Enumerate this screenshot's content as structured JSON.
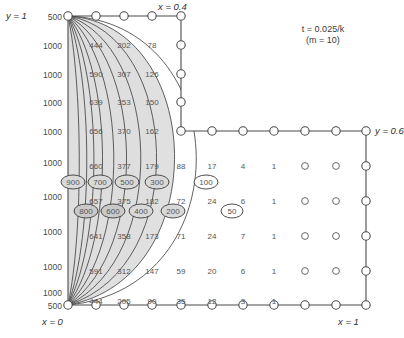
{
  "figure": {
    "annotation": {
      "line1": "t = 0.025/k",
      "line2": "(m = 10)",
      "t_symbol": "t",
      "t_value": "= 0.025/k",
      "m_symbol": "m",
      "m_value": "= 10)"
    },
    "axis_labels": {
      "top_left": "y = 1",
      "top_right": "x = 0.4",
      "bottom_left": "x = 0",
      "bottom_right": "x = 1",
      "right": "y = 0.6"
    },
    "boundary_row_labels": [
      "500",
      "1000",
      "1000",
      "1000",
      "1000",
      "1000",
      "1000",
      "1000",
      "1000",
      "1000",
      "500"
    ],
    "contour_labels_upper": [
      "900",
      "700",
      "500",
      "300",
      "100"
    ],
    "contour_labels_lower": [
      "800",
      "600",
      "400",
      "200"
    ],
    "contour_label_50": "50"
  },
  "chart_data": {
    "type": "heatmap",
    "subtitle": "t = 0.025/k (m = 10)",
    "xlabel": "x",
    "ylabel": "y",
    "xlim": [
      0,
      1
    ],
    "ylim": [
      0,
      1
    ],
    "grid": true,
    "legend": "none",
    "domain_notes": "L-shaped domain: vertical boundary at x = 0.4 from y = 1 down to y = 0.6, then horizontal boundary to x = 1",
    "left_boundary_values": [
      500,
      1000,
      1000,
      1000,
      1000,
      1000,
      1000,
      1000,
      1000,
      1000,
      500
    ],
    "contour_levels": [
      100,
      200,
      300,
      400,
      500,
      600,
      700,
      800,
      900
    ],
    "extra_contour_levels": [
      50
    ],
    "nodal_rows": [
      {
        "row": 1,
        "values": [
          null,
          null,
          null,
          null,
          null,
          null,
          null,
          null
        ]
      },
      {
        "row": 2,
        "values": [
          444,
          202,
          78,
          null,
          null,
          null,
          null,
          null
        ]
      },
      {
        "row": 3,
        "values": [
          590,
          307,
          126,
          null,
          null,
          null,
          null,
          null
        ]
      },
      {
        "row": 4,
        "values": [
          639,
          353,
          150,
          null,
          null,
          null,
          null,
          null
        ]
      },
      {
        "row": 5,
        "values": [
          656,
          370,
          162,
          null,
          null,
          null,
          null,
          null
        ]
      },
      {
        "row": 6,
        "values": [
          660,
          377,
          179,
          88,
          17,
          4,
          1,
          0
        ]
      },
      {
        "row": 7,
        "values": [
          657,
          375,
          182,
          72,
          24,
          6,
          1,
          0
        ]
      },
      {
        "row": 8,
        "values": [
          641,
          358,
          173,
          71,
          24,
          7,
          1,
          0
        ]
      },
      {
        "row": 9,
        "values": [
          591,
          312,
          147,
          59,
          20,
          6,
          1,
          0
        ]
      },
      {
        "row": 10,
        "values": [
          444,
          205,
          90,
          35,
          12,
          3,
          1,
          0
        ]
      }
    ],
    "columns_with_zero_circles": [
      7,
      8
    ]
  }
}
